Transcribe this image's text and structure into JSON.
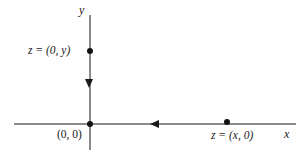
{
  "figure": {
    "background_color": "#ffffff",
    "axis_color": "#8a8a8a",
    "marker_color": "#111111",
    "width": 307,
    "height": 157
  },
  "axes": {
    "x_axis_name": "x",
    "y_axis_name": "y"
  },
  "labels": {
    "imaginary_point": "z = (0, y)",
    "origin": "(0, 0)",
    "real_point": "z = (x, 0)"
  },
  "chart_data": {
    "type": "scatter",
    "title": "",
    "xlabel": "x",
    "ylabel": "y",
    "grid": false,
    "legend": "none",
    "xlim": [
      -1.35,
      2.9
    ],
    "ylim": [
      -0.5,
      2.1
    ],
    "points": [
      {
        "label": "z = (0, y)",
        "x": 0,
        "y": 1.2,
        "label_position": "left"
      },
      {
        "label": "(0, 0)",
        "x": 0,
        "y": 0,
        "label_position": "below-left"
      },
      {
        "label": "z = (x, 0)",
        "x": 2.0,
        "y": 0,
        "label_position": "below"
      }
    ],
    "annotations": [
      {
        "type": "arrowhead",
        "axis": "y",
        "direction": "down",
        "at": [
          0,
          0.62
        ]
      },
      {
        "type": "arrowhead",
        "axis": "x",
        "direction": "left",
        "at": [
          1.0,
          0
        ]
      }
    ]
  }
}
